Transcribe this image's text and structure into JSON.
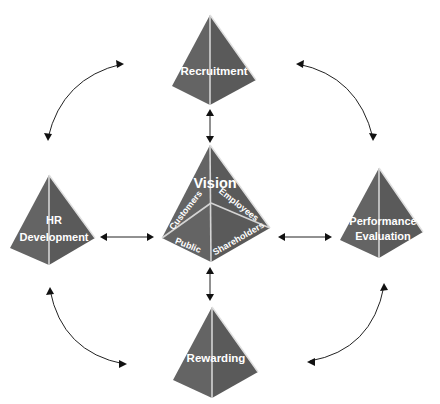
{
  "diagram": {
    "center": {
      "title": "Vision",
      "facets": [
        "Customers",
        "Employees",
        "Public",
        "Shareholders"
      ]
    },
    "nodes": [
      {
        "id": "recruitment",
        "label": "Recruitment",
        "lines": [
          "Recruitment"
        ]
      },
      {
        "id": "hr-development",
        "label": "HR Development",
        "lines": [
          "HR",
          "Development"
        ]
      },
      {
        "id": "performance-evaluation",
        "label": "Performance Evaluation",
        "lines": [
          "Performance",
          "Evaluation"
        ]
      },
      {
        "id": "rewarding",
        "label": "Rewarding",
        "lines": [
          "Rewarding"
        ]
      }
    ],
    "colors": {
      "pyramid_fill": "#646464",
      "pyramid_edge": "#d4d4d4",
      "label": "#ffffff",
      "arrow": "#222222",
      "background": "#ffffff"
    }
  }
}
